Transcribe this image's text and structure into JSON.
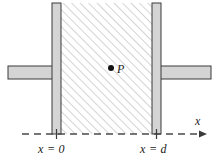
{
  "figure": {
    "labels": {
      "x_zero": "x = 0",
      "x_d": "x = d",
      "axis_x": "x",
      "point_p": "P"
    },
    "colors": {
      "plate_fill": "#d4d4d4",
      "plate_stroke": "#3a3a3a",
      "hatch_line": "#b8b8b8",
      "axis_line": "#4a4a4a",
      "text": "#1a1a1a",
      "background": "#ffffff"
    },
    "geometry": {
      "left_plate_x": 52,
      "left_plate_width": 9,
      "right_plate_x": 152,
      "right_plate_width": 9,
      "plate_top": 3,
      "plate_bottom": 134,
      "arm_top": 66,
      "arm_height": 13,
      "left_arm_start": 8,
      "right_arm_end": 211,
      "hatch_left": 61,
      "hatch_right": 152,
      "axis_y": 134,
      "axis_start": 22,
      "axis_end": 206,
      "point_p_x": 111,
      "point_p_y": 68,
      "hatch_angle_deg": 45
    }
  }
}
